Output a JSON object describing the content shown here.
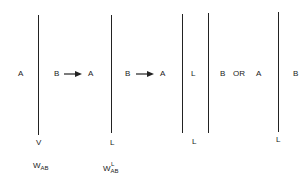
{
  "diagram": {
    "panels": [
      {
        "id": "panel-1",
        "left_label": "A",
        "right_label": "B",
        "bottom_label": "V",
        "work_label": {
          "base": "W",
          "subscript": "AB",
          "superscript": ""
        }
      },
      {
        "id": "panel-2",
        "left_label": "A",
        "right_label": "B",
        "bottom_label": "L",
        "work_label": {
          "base": "W",
          "subscript": "AB",
          "superscript": "L"
        }
      },
      {
        "id": "panel-3",
        "left_label": "A",
        "middle_label": "L",
        "right_label": "B",
        "bottom_label": "L"
      },
      {
        "id": "panel-4",
        "left_label": "A",
        "right_label": "B",
        "bottom_label": "L"
      }
    ],
    "connectors": {
      "arrow_1": "→",
      "arrow_2": "→",
      "or_text": "OR"
    },
    "colors": {
      "line": "#222222",
      "text": "#1a1a1a",
      "background": "#ffffff"
    }
  }
}
